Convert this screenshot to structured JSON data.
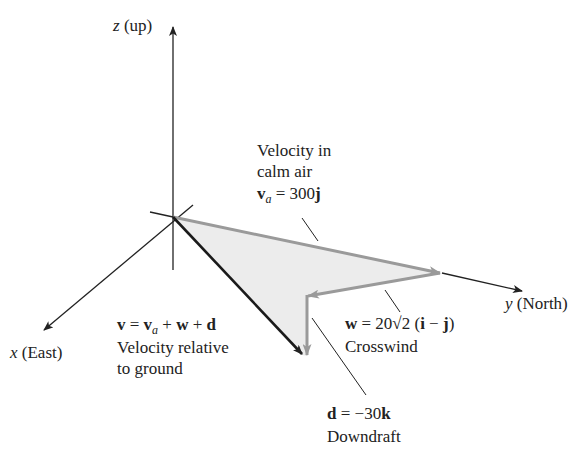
{
  "figure": {
    "axes": {
      "z": {
        "name": "z",
        "label": "(up)"
      },
      "y": {
        "name": "y",
        "label": "(North)"
      },
      "x": {
        "name": "x",
        "label": "(East)"
      }
    },
    "vectors": {
      "va": {
        "caption_line1": "Velocity in",
        "caption_line2": "calm air",
        "symbol": "v",
        "subscript": "a",
        "equation": "= 300",
        "unit": "j"
      },
      "w": {
        "symbol": "w",
        "equation": "= 20√2 (",
        "i": "i",
        "minus": " − ",
        "j": "j",
        "close": ")",
        "caption": "Crosswind"
      },
      "d": {
        "symbol": "d",
        "equation": "= −30",
        "unit": "k",
        "caption": "Downdraft"
      },
      "v": {
        "symbol": "v",
        "eq": " = ",
        "va": "v",
        "va_sub": "a",
        "plus1": " + ",
        "w": "w",
        "plus2": " + ",
        "d": "d",
        "caption_line1": "Velocity relative",
        "caption_line2": "to ground"
      }
    },
    "colors": {
      "axis": "#222222",
      "resultant": "#1a1a1a",
      "component": "#9a9a9a",
      "fill": "#ececec"
    }
  }
}
